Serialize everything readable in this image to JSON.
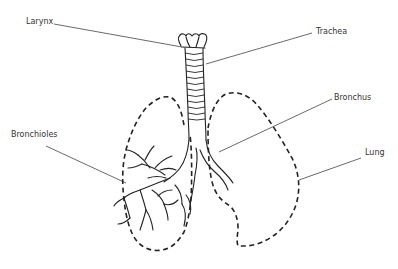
{
  "diagram": {
    "labels": {
      "larynx": "Larynx",
      "trachea": "Trachea",
      "bronchus": "Bronchus",
      "bronchioles": "Bronchioles",
      "lung": "Lung"
    },
    "colors": {
      "line": "#222222",
      "text": "#333333",
      "background": "#ffffff"
    }
  }
}
